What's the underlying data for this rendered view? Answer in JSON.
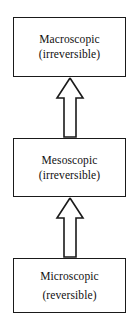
{
  "diagram": {
    "background_color": "#ffffff",
    "line_color": "#1a1a1a",
    "boxes": [
      {
        "id": "macroscopic",
        "label": "Macroscopic",
        "qualifier": "(irreversible)"
      },
      {
        "id": "mesoscopic",
        "label": "Mesoscopic",
        "qualifier": "(irreversible)"
      },
      {
        "id": "microscopic",
        "label": "Microscopic",
        "qualifier": "(reversible)"
      }
    ],
    "arrows": [
      {
        "id": "micro-to-meso",
        "direction": "up",
        "from": "microscopic",
        "to": "mesoscopic",
        "style": "hollow-block-arrow"
      },
      {
        "id": "meso-to-macro",
        "direction": "up",
        "from": "mesoscopic",
        "to": "macroscopic",
        "style": "hollow-block-arrow"
      }
    ]
  }
}
